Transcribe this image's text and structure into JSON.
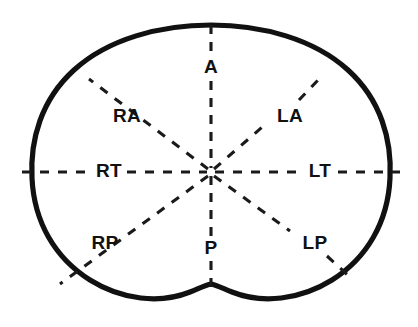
{
  "figure": {
    "kind": "anatomical-sector-diagram",
    "colors": {
      "outline": "#111111",
      "dashed_line": "#1a1a1a",
      "label_text": "#111111",
      "background": "#ffffff"
    },
    "center": {
      "x": 211,
      "y": 172
    },
    "labels": [
      {
        "id": "A",
        "text": "A",
        "position": "top",
        "x": 211,
        "y": 68,
        "meaning": "anterior"
      },
      {
        "id": "P",
        "text": "P",
        "position": "bottom",
        "x": 211,
        "y": 249,
        "meaning": "posterior"
      },
      {
        "id": "RT",
        "text": "RT",
        "position": "left",
        "x": 109,
        "y": 172,
        "meaning": "right transverse"
      },
      {
        "id": "LT",
        "text": "LT",
        "position": "right",
        "x": 320,
        "y": 172,
        "meaning": "left transverse"
      },
      {
        "id": "RA",
        "text": "RA",
        "position": "upper-left",
        "x": 127,
        "y": 117,
        "meaning": "right anterior"
      },
      {
        "id": "LA",
        "text": "LA",
        "position": "upper-right",
        "x": 290,
        "y": 117,
        "meaning": "left anterior"
      },
      {
        "id": "RP",
        "text": "RP",
        "position": "lower-left",
        "x": 105,
        "y": 244,
        "meaning": "right posterior"
      },
      {
        "id": "LP",
        "text": "LP",
        "position": "lower-right",
        "x": 315,
        "y": 244,
        "meaning": "left posterior"
      }
    ],
    "sector_lines": [
      {
        "id": "line-A",
        "label": "A",
        "from": {
          "x": 211,
          "y": 172
        },
        "to": {
          "x": 211,
          "y": 25
        }
      },
      {
        "id": "line-P",
        "label": "P",
        "from": {
          "x": 211,
          "y": 172
        },
        "to": {
          "x": 211,
          "y": 288
        }
      },
      {
        "id": "line-RT",
        "label": "RT",
        "from": {
          "x": 211,
          "y": 172
        },
        "to": {
          "x": 22,
          "y": 172
        }
      },
      {
        "id": "line-LT",
        "label": "LT",
        "from": {
          "x": 211,
          "y": 172
        },
        "to": {
          "x": 400,
          "y": 172
        }
      },
      {
        "id": "line-RA",
        "label": "RA",
        "from": {
          "x": 211,
          "y": 172
        },
        "to": {
          "x": 89,
          "y": 79
        }
      },
      {
        "id": "line-LA",
        "label": "LA",
        "from": {
          "x": 211,
          "y": 172
        },
        "to": {
          "x": 319,
          "y": 79
        }
      },
      {
        "id": "line-RP",
        "label": "RP",
        "from": {
          "x": 211,
          "y": 172
        },
        "to": {
          "x": 60,
          "y": 284
        }
      },
      {
        "id": "line-LP",
        "label": "LP",
        "from": {
          "x": 211,
          "y": 172
        },
        "to": {
          "x": 351,
          "y": 278
        }
      }
    ]
  }
}
